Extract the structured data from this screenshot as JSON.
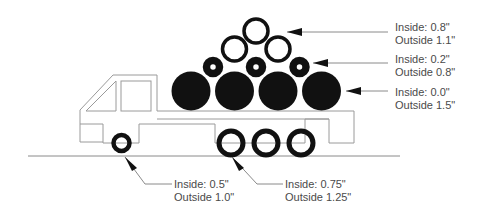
{
  "diagram": {
    "colors": {
      "fill": "#111111",
      "outline": "#9a9a9a",
      "leader": "#8a8a8a",
      "text": "#4a4a4a"
    },
    "callouts": [
      {
        "id": "top-rings",
        "inside": "Inside: 0.8\"",
        "outside": "Outside 1.1\""
      },
      {
        "id": "small-rings",
        "inside": "Inside: 0.2\"",
        "outside": "Outside 0.8\""
      },
      {
        "id": "solid-pipes",
        "inside": "Inside: 0.0\"",
        "outside": "Outside 1.5\""
      },
      {
        "id": "front-wheel",
        "inside": "Inside: 0.5\"",
        "outside": "Outside 1.0\""
      },
      {
        "id": "rear-wheels",
        "inside": "Inside: 0.75\"",
        "outside": "Outside 1.25\""
      }
    ]
  }
}
